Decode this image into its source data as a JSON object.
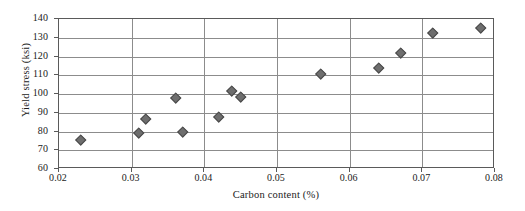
{
  "chart_data": {
    "type": "scatter",
    "title": "",
    "xlabel": "Carbon content (%)",
    "ylabel": "Yield stress (ksi)",
    "xlim": [
      0.02,
      0.08
    ],
    "ylim": [
      60,
      140
    ],
    "xticks": [
      "0.02",
      "0.03",
      "0.04",
      "0.05",
      "0.06",
      "0.07",
      "0.08"
    ],
    "xtick_values": [
      0.02,
      0.03,
      0.04,
      0.05,
      0.06,
      0.07,
      0.08
    ],
    "yticks": [
      "60",
      "70",
      "80",
      "90",
      "100",
      "110",
      "120",
      "130",
      "140"
    ],
    "ytick_values": [
      60,
      70,
      80,
      90,
      100,
      110,
      120,
      130,
      140
    ],
    "grid": "both",
    "legend": "none",
    "marker": "diamond",
    "marker_color": "#6e6e6e",
    "marker_edge_color": "#4a4a4a",
    "axis_color": "#5a5a5a",
    "grid_color": "#8c8c8c",
    "background": "#ffffff",
    "x": [
      0.023,
      0.031,
      0.032,
      0.036,
      0.037,
      0.042,
      0.0438,
      0.045,
      0.056,
      0.064,
      0.067,
      0.0715,
      0.078
    ],
    "y": [
      75.5,
      79.5,
      87.0,
      98.0,
      80.0,
      88.0,
      101.5,
      98.5,
      111.0,
      114.0,
      122.0,
      132.5,
      135.5
    ],
    "points": [
      {
        "x": 0.023,
        "y": 75.5
      },
      {
        "x": 0.031,
        "y": 79.5
      },
      {
        "x": 0.032,
        "y": 87.0
      },
      {
        "x": 0.036,
        "y": 98.0
      },
      {
        "x": 0.037,
        "y": 80.0
      },
      {
        "x": 0.042,
        "y": 88.0
      },
      {
        "x": 0.0438,
        "y": 101.5
      },
      {
        "x": 0.045,
        "y": 98.5
      },
      {
        "x": 0.056,
        "y": 111.0
      },
      {
        "x": 0.064,
        "y": 114.0
      },
      {
        "x": 0.067,
        "y": 122.0
      },
      {
        "x": 0.0715,
        "y": 132.5
      },
      {
        "x": 0.078,
        "y": 135.5
      }
    ]
  }
}
